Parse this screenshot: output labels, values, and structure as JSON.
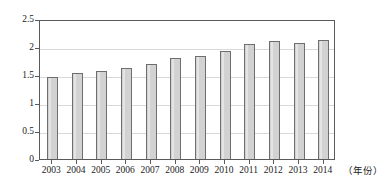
{
  "chart_data": {
    "type": "bar",
    "title": "",
    "subtitle": "",
    "xlabel": "（年份）",
    "ylabel": "",
    "categories": [
      "2003",
      "2004",
      "2005",
      "2006",
      "2007",
      "2008",
      "2009",
      "2010",
      "2011",
      "2012",
      "2013",
      "2014"
    ],
    "values": [
      1.47,
      1.53,
      1.57,
      1.62,
      1.7,
      1.8,
      1.84,
      1.93,
      2.06,
      2.11,
      2.08,
      2.12
    ],
    "series": [
      {
        "name": "",
        "values": [
          1.47,
          1.53,
          1.57,
          1.62,
          1.7,
          1.8,
          1.84,
          1.93,
          2.06,
          2.11,
          2.08,
          2.12
        ]
      }
    ],
    "ylim": [
      0,
      2.5
    ],
    "ytick_labels": [
      "0",
      "0.5",
      "1",
      "1.5",
      "2",
      "2.5"
    ],
    "ytick_values": [
      0,
      0.5,
      1,
      1.5,
      2,
      2.5
    ],
    "grid": "horizontal",
    "legend": "none",
    "bar_color": "#d2d2d2",
    "bar_border_color": "#6e6e6e",
    "axis_color": "#5a5a5a",
    "gridline_color": "#d9d9d9"
  }
}
